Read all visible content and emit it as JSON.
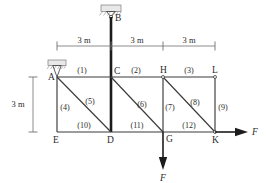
{
  "figure": {
    "background_color": "#ffffff",
    "line_color": "#3a3a3a",
    "mast_color": "#1c1c1c"
  },
  "nodes": [
    {
      "id": "A",
      "label": "A",
      "x": 57,
      "y": 77
    },
    {
      "id": "C",
      "label": "C",
      "x": 111,
      "y": 77
    },
    {
      "id": "H",
      "label": "H",
      "x": 163,
      "y": 77
    },
    {
      "id": "L",
      "label": "L",
      "x": 215,
      "y": 77
    },
    {
      "id": "E",
      "label": "E",
      "x": 57,
      "y": 132
    },
    {
      "id": "D",
      "label": "D",
      "x": 111,
      "y": 132
    },
    {
      "id": "G",
      "label": "G",
      "x": 163,
      "y": 132
    },
    {
      "id": "K",
      "label": "K",
      "x": 215,
      "y": 132
    },
    {
      "id": "B",
      "label": "B",
      "x": 111,
      "y": 17
    }
  ],
  "members": [
    {
      "id": 1,
      "label": "(1)",
      "from": "A",
      "to": "C",
      "kind": "top-chord",
      "label_x": 82,
      "label_y": 73
    },
    {
      "id": 2,
      "label": "(2)",
      "from": "C",
      "to": "H",
      "kind": "top-chord",
      "label_x": 136,
      "label_y": 73
    },
    {
      "id": 3,
      "label": "(3)",
      "from": "H",
      "to": "L",
      "kind": "top-chord",
      "label_x": 189,
      "label_y": 73
    },
    {
      "id": 4,
      "label": "(4)",
      "from": "A",
      "to": "E",
      "kind": "vertical",
      "label_x": 63,
      "label_y": 108
    },
    {
      "id": 5,
      "label": "(5)",
      "from": "A",
      "to": "D",
      "kind": "diagonal",
      "label_x": 89,
      "label_y": 103
    },
    {
      "id": 6,
      "label": "(6)",
      "from": "C",
      "to": "G",
      "kind": "diagonal",
      "label_x": 141,
      "label_y": 106
    },
    {
      "id": 7,
      "label": "(7)",
      "from": "H",
      "to": "G",
      "kind": "vertical",
      "label_x": 168,
      "label_y": 108
    },
    {
      "id": 8,
      "label": "(8)",
      "from": "H",
      "to": "K",
      "kind": "diagonal",
      "label_x": 193,
      "label_y": 104
    },
    {
      "id": 9,
      "label": "(9)",
      "from": "L",
      "to": "K",
      "kind": "vertical",
      "label_x": 221,
      "label_y": 108
    },
    {
      "id": 10,
      "label": "(10)",
      "from": "E",
      "to": "D",
      "kind": "bottom-chord",
      "label_x": 84,
      "label_y": 128
    },
    {
      "id": 11,
      "label": "(11)",
      "from": "D",
      "to": "G",
      "kind": "bottom-chord",
      "label_x": 137,
      "label_y": 128
    },
    {
      "id": 12,
      "label": "(12)",
      "from": "G",
      "to": "K",
      "kind": "bottom-chord",
      "label_x": 189,
      "label_y": 128
    }
  ],
  "mast": {
    "from": "B",
    "to": "D",
    "description": "thick vertical member from support B through C down to D"
  },
  "supports": [
    {
      "at": "A",
      "type": "pin-support",
      "symbol": "hatched-block-with-triangle"
    },
    {
      "at": "B",
      "type": "pin-support",
      "symbol": "hatched-block-with-triangle"
    }
  ],
  "dimensions": {
    "horizontal": [
      {
        "label": "3 m",
        "from": "A",
        "to": "C",
        "label_x": 84,
        "label_y": 54
      },
      {
        "label": "3 m",
        "from": "C",
        "to": "H",
        "label_x": 137,
        "label_y": 54
      },
      {
        "label": "3 m",
        "from": "H",
        "to": "L",
        "label_x": 189,
        "label_y": 54
      }
    ],
    "vertical": [
      {
        "label": "3 m",
        "from": "A",
        "to": "E",
        "label_x": 18,
        "label_y": 107
      }
    ]
  },
  "forces": [
    {
      "label": "F",
      "at": "G",
      "direction": "down",
      "label_x": 163,
      "label_y": 178
    },
    {
      "label": "F",
      "at": "K",
      "direction": "right",
      "label_x": 254,
      "label_y": 133
    }
  ]
}
